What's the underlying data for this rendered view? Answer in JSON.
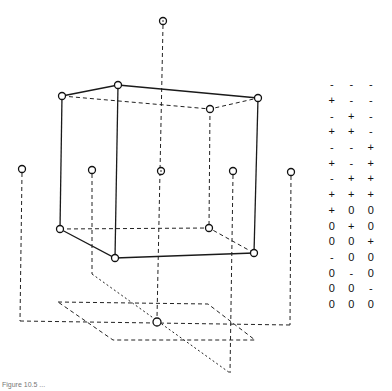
{
  "figure": {
    "caption": "Figure 10.5 ...",
    "colors": {
      "line": "#1a1a1a",
      "background": "#ffffff"
    }
  },
  "design_table": {
    "columns": [
      "x1",
      "x2",
      "x3"
    ],
    "rows": [
      [
        "-",
        "-",
        "-"
      ],
      [
        "+",
        "-",
        "-"
      ],
      [
        "-",
        "+",
        "-"
      ],
      [
        "+",
        "+",
        "-"
      ],
      [
        "-",
        "-",
        "+"
      ],
      [
        "+",
        "-",
        "+"
      ],
      [
        "-",
        "+",
        "+"
      ],
      [
        "+",
        "+",
        "+"
      ],
      [
        "+",
        "0",
        "0"
      ],
      [
        "0",
        "+",
        "0"
      ],
      [
        "0",
        "0",
        "+"
      ],
      [
        "-",
        "0",
        "0"
      ],
      [
        "0",
        "-",
        "0"
      ],
      [
        "0",
        "0",
        "-"
      ],
      [
        "0",
        "0",
        "0"
      ]
    ]
  },
  "geometry": {
    "cube_top": [
      [
        62,
        96
      ],
      [
        118,
        85
      ],
      [
        258,
        98
      ],
      [
        210,
        109
      ]
    ],
    "cube_bottom": [
      [
        60,
        229
      ],
      [
        115,
        258
      ],
      [
        254,
        253
      ],
      [
        209,
        228
      ]
    ],
    "star_points": {
      "top": [
        163,
        21
      ],
      "bottom": [
        157,
        322
      ],
      "mid_row": [
        [
          22,
          169
        ],
        [
          92,
          170
        ],
        [
          161,
          171
        ],
        [
          233,
          171
        ],
        [
          291,
          172
        ]
      ]
    },
    "floor_plane": [
      [
        58,
        302
      ],
      [
        208,
        304
      ],
      [
        255,
        340
      ],
      [
        113,
        340
      ]
    ]
  }
}
